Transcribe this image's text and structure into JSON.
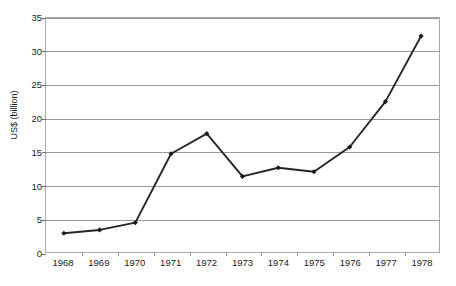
{
  "chart_data": {
    "type": "line",
    "title": "",
    "subtitle": "",
    "xlabel": "",
    "ylabel": "US$ (billion)",
    "categories": [
      "1968",
      "1969",
      "1970",
      "1971",
      "1972",
      "1973",
      "1974",
      "1975",
      "1976",
      "1977",
      "1978"
    ],
    "values": [
      2.8,
      3.3,
      4.4,
      14.7,
      17.7,
      11.3,
      12.6,
      12.0,
      15.7,
      22.5,
      32.3
    ],
    "series": [
      {
        "name": "US$ (billion)",
        "values": [
          2.8,
          3.3,
          4.4,
          14.7,
          17.7,
          11.3,
          12.6,
          12.0,
          15.7,
          22.5,
          32.3
        ]
      }
    ],
    "ylim": [
      0,
      35
    ],
    "yticks": [
      0,
      5,
      10,
      15,
      20,
      25,
      30,
      35
    ],
    "grid": "horizontal",
    "legend": "none",
    "marker": "diamond",
    "line_color": "#262626",
    "marker_color": "#1a1a1a",
    "grid_color": "#9a9a9a",
    "axis_color": "#a8a8a8",
    "background": "#ffffff"
  }
}
